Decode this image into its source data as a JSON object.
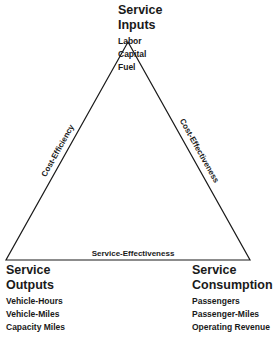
{
  "nodes": {
    "inputs": {
      "title_line1": "Service",
      "title_line2": "Inputs",
      "items": [
        "Labor",
        "Capital",
        "Fuel"
      ]
    },
    "outputs": {
      "title_line1": "Service",
      "title_line2": "Outputs",
      "items": [
        "Vehicle-Hours",
        "Vehicle-Miles",
        "Capacity Miles"
      ]
    },
    "consumption": {
      "title_line1": "Service",
      "title_line2": "Consumption",
      "items": [
        "Passengers",
        "Passenger-Miles",
        "Operating Revenue"
      ]
    }
  },
  "edges": {
    "left": "Cost-Efficiency",
    "right": "Cost-Effectiveness",
    "bottom": "Service-Effectiveness"
  },
  "colors": {
    "line": "#1a1a1a",
    "background": "#ffffff"
  }
}
